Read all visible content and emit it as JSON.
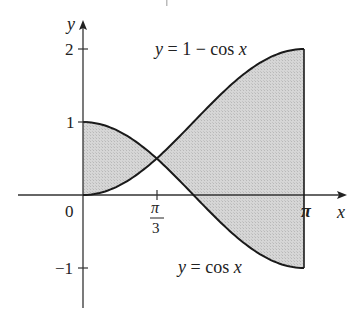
{
  "figure": {
    "type": "area-between-curves",
    "axes": {
      "x_label": "x",
      "y_label": "y",
      "x_ticks": [
        {
          "value": 0,
          "label": "0"
        },
        {
          "value": 1.0472,
          "label_num": "π",
          "label_den": "3"
        },
        {
          "value": 3.14159,
          "label": "π"
        }
      ],
      "y_ticks": [
        {
          "value": 2,
          "label": "2"
        },
        {
          "value": 1,
          "label": "1"
        },
        {
          "value": -1,
          "label": "−1"
        }
      ]
    },
    "curves": [
      {
        "name": "one-minus-cos",
        "label": "y = 1 − cos x",
        "label_parts": [
          "y",
          " = 1 − cos ",
          "x"
        ]
      },
      {
        "name": "cos",
        "label": "y = cos x",
        "label_parts": [
          "y",
          " = cos ",
          "x"
        ]
      }
    ],
    "shaded_region": {
      "x_from": 0,
      "x_to": 3.14159,
      "between": [
        "cos x",
        "1 − cos x"
      ],
      "color": "#cfcfcf"
    },
    "intersection": {
      "x": 1.0472,
      "y": 0.5
    },
    "colors": {
      "curve": "#1a1a1a",
      "axis": "#333333",
      "fill": "#cfcfcf"
    }
  }
}
